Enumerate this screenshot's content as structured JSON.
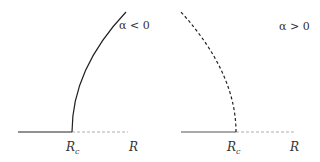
{
  "panels": [
    {
      "condition": "α < 0",
      "critical_label": "R",
      "critical_sub": "c",
      "axis_label": "R",
      "branch_style": "solid",
      "description": "supercritical: branch bends right from R_c, baseline solid left of R_c and dashed right of R_c"
    },
    {
      "condition": "α > 0",
      "critical_label": "R",
      "critical_sub": "c",
      "axis_label": "R",
      "branch_style": "dashed",
      "description": "subcritical: dashed branch bends left from R_c, baseline solid left of R_c and dashed right of R_c"
    }
  ],
  "colors": {
    "line": "#222222",
    "dashed_axis": "#999999",
    "text": "#333333"
  }
}
